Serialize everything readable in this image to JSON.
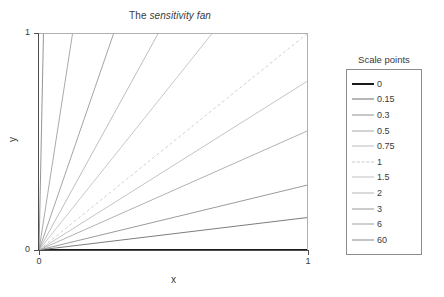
{
  "chart_data": {
    "type": "line",
    "title": "The sensitivity fan",
    "title_plain": "The ",
    "title_italic": "sensitivity fan",
    "xlabel": "x",
    "ylabel": "y",
    "xlim": [
      0,
      1
    ],
    "ylim": [
      0,
      1
    ],
    "xticks": [
      "0",
      "1"
    ],
    "yticks": [
      "0",
      "1"
    ],
    "grid": false,
    "legend_position": "right",
    "legend_title": "Scale points",
    "series": [
      {
        "name": "0",
        "slope": 0,
        "color": "#1a1a1a",
        "width": 2.0,
        "dash": "none",
        "points": [
          [
            0,
            0
          ],
          [
            1,
            0
          ]
        ]
      },
      {
        "name": "0.15",
        "slope": 0.15,
        "color": "#6e6e6e",
        "width": 0.9,
        "dash": "none",
        "points": [
          [
            0,
            0
          ],
          [
            1,
            0.15
          ]
        ]
      },
      {
        "name": "0.3",
        "slope": 0.3,
        "color": "#8f8f8f",
        "width": 0.9,
        "dash": "none",
        "points": [
          [
            0,
            0
          ],
          [
            1,
            0.3
          ]
        ]
      },
      {
        "name": "0.5",
        "slope": 0.55,
        "color": "#a8a8a8",
        "width": 0.9,
        "dash": "none",
        "points": [
          [
            0,
            0
          ],
          [
            1,
            0.55
          ]
        ]
      },
      {
        "name": "0.75",
        "slope": 0.78,
        "color": "#bcbcbc",
        "width": 0.9,
        "dash": "none",
        "points": [
          [
            0,
            0
          ],
          [
            1,
            0.78
          ]
        ]
      },
      {
        "name": "1",
        "slope": 1.0,
        "color": "#c9c9c9",
        "width": 0.9,
        "dash": "dashed",
        "points": [
          [
            0,
            0
          ],
          [
            1,
            1
          ]
        ]
      },
      {
        "name": "1.5",
        "slope": 1.55,
        "color": "#c2c2c2",
        "width": 0.9,
        "dash": "none",
        "points": [
          [
            0,
            0
          ],
          [
            0.645,
            1
          ]
        ]
      },
      {
        "name": "2",
        "slope": 2.25,
        "color": "#b5b5b5",
        "width": 0.9,
        "dash": "none",
        "points": [
          [
            0,
            0
          ],
          [
            0.444,
            1
          ]
        ]
      },
      {
        "name": "3",
        "slope": 3.6,
        "color": "#9a9a9a",
        "width": 0.9,
        "dash": "none",
        "points": [
          [
            0,
            0
          ],
          [
            0.278,
            1
          ]
        ]
      },
      {
        "name": "6",
        "slope": 8.0,
        "color": "#a0a0a0",
        "width": 0.9,
        "dash": "none",
        "points": [
          [
            0,
            0
          ],
          [
            0.125,
            1
          ]
        ]
      },
      {
        "name": "60",
        "slope": 60.0,
        "color": "#8a8a8a",
        "width": 0.9,
        "dash": "none",
        "points": [
          [
            0,
            0
          ],
          [
            0.0167,
            1
          ]
        ]
      }
    ]
  },
  "legend": {
    "title": "Scale points",
    "items": [
      {
        "label": "0"
      },
      {
        "label": "0.15"
      },
      {
        "label": "0.3"
      },
      {
        "label": "0.5"
      },
      {
        "label": "0.75"
      },
      {
        "label": "1"
      },
      {
        "label": "1.5"
      },
      {
        "label": "2"
      },
      {
        "label": "3"
      },
      {
        "label": "6"
      },
      {
        "label": "60"
      }
    ]
  },
  "axes": {
    "x_title": "x",
    "y_title": "y",
    "x_tick_0": "0",
    "x_tick_1": "1",
    "y_tick_0": "0",
    "y_tick_1": "1"
  },
  "colors": {
    "axis": "#4d4d4d",
    "text": "#3a3a3a",
    "legend_border": "#8c8c8c",
    "background": "#ffffff"
  }
}
